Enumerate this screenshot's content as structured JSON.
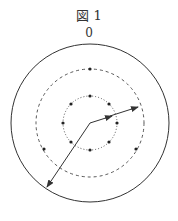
{
  "figure": {
    "title": "図 1",
    "top_label": "0"
  },
  "diagram": {
    "center": [
      90,
      123
    ],
    "outer_radius": 79,
    "middle_radius": 54,
    "inner_radius": 27,
    "inner_dots": 8,
    "middle_dots": 6,
    "colors": {
      "stroke": "#333333"
    }
  }
}
